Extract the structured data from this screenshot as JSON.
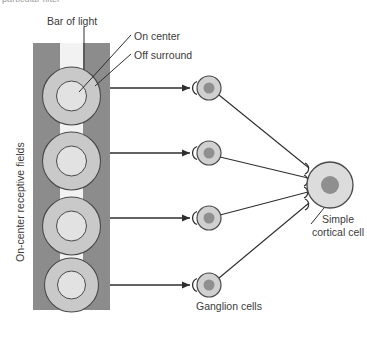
{
  "figure": {
    "clipped_caption": "particular filter",
    "labels": {
      "bar_of_light": "Bar of light",
      "on_center": "On center",
      "off_surround": "Off surround",
      "ganglion_cells": "Ganglion cells",
      "simple_cortical_cell": "Simple cortical cell",
      "receptive_fields_axis": "On-center receptive fields"
    },
    "colors": {
      "background": "#ffffff",
      "receptive_field_column": "#8c8c8c",
      "bar_of_light": "#f2f2f2",
      "off_surround_ring": "#c9c9c9",
      "on_center_disc": "#e2e2e2",
      "ganglion_soma": "#d0d0d0",
      "ganglion_nucleus": "#8f8f8f",
      "cortical_soma": "#dcdcdc",
      "cortical_nucleus": "#8f8f8f",
      "outline": "#4a4a4a",
      "text": "#3b3b3b",
      "clipped_text": "#9a9a9a"
    },
    "receptive_field_column": {
      "x": 33,
      "y": 43,
      "width": 77,
      "height": 267
    },
    "bar_of_light": {
      "x": 60,
      "y": 43,
      "width": 23,
      "height": 267
    },
    "receptive_fields": [
      {
        "cx": 71.5,
        "cy": 96,
        "outer_r": 29,
        "inner_r": 15
      },
      {
        "cx": 71.5,
        "cy": 161,
        "outer_r": 29,
        "inner_r": 15
      },
      {
        "cx": 71.5,
        "cy": 226,
        "outer_r": 29,
        "inner_r": 15
      },
      {
        "cx": 71.5,
        "cy": 285,
        "outer_r": 27,
        "inner_r": 14
      }
    ],
    "ganglion_cells": [
      {
        "cx": 209,
        "cy": 88,
        "soma_r": 12,
        "nucleus_r": 5.5
      },
      {
        "cx": 209,
        "cy": 153,
        "soma_r": 12,
        "nucleus_r": 5.5
      },
      {
        "cx": 209,
        "cy": 218,
        "soma_r": 12,
        "nucleus_r": 5.5
      },
      {
        "cx": 209,
        "cy": 285,
        "soma_r": 12,
        "nucleus_r": 5.5
      }
    ],
    "cortical_cell": {
      "cx": 330,
      "cy": 185,
      "soma_r": 23,
      "nucleus_r": 9,
      "synapse_count": 4
    },
    "connections": {
      "receptive_field_to_ganglion": 4,
      "ganglion_to_cortical": 4
    },
    "leader_lines": {
      "bar_of_light": true,
      "on_center": true,
      "off_surround": true,
      "simple_cortical_cell": true
    }
  }
}
